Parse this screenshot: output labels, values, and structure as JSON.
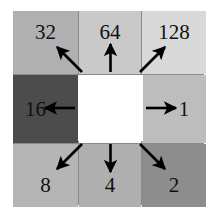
{
  "figure": {
    "name": "lbp-weight-grid",
    "center": {
      "fill": "#ffffff",
      "label": ""
    },
    "gridline_color": "#8a8a8a",
    "background": "#ffffff"
  },
  "cells": [
    {
      "id": "cell-32",
      "label": "32",
      "row": 0,
      "col": 0,
      "fill": "#b0b0b0",
      "arrow": "arrow-up-left"
    },
    {
      "id": "cell-64",
      "label": "64",
      "row": 0,
      "col": 1,
      "fill": "#c9c9c9",
      "arrow": "arrow-up"
    },
    {
      "id": "cell-128",
      "label": "128",
      "row": 0,
      "col": 2,
      "fill": "#d9d9d9",
      "arrow": "arrow-up-right"
    },
    {
      "id": "cell-16",
      "label": "16",
      "row": 1,
      "col": 0,
      "fill": "#4c4c4c",
      "arrow": "arrow-left"
    },
    {
      "id": "cell-center",
      "label": "",
      "row": 1,
      "col": 1,
      "fill": "#ffffff",
      "arrow": ""
    },
    {
      "id": "cell-1",
      "label": "1",
      "row": 1,
      "col": 2,
      "fill": "#bdbdbd",
      "arrow": "arrow-right"
    },
    {
      "id": "cell-8",
      "label": "8",
      "row": 2,
      "col": 0,
      "fill": "#b5b5b5",
      "arrow": "arrow-down-left"
    },
    {
      "id": "cell-4",
      "label": "4",
      "row": 2,
      "col": 1,
      "fill": "#afafaf",
      "arrow": "arrow-down"
    },
    {
      "id": "cell-2",
      "label": "2",
      "row": 2,
      "col": 2,
      "fill": "#8d8d8d",
      "arrow": "arrow-down-right"
    }
  ],
  "arrows": {
    "color": "#000000",
    "count": 8,
    "directions": [
      "up-left",
      "up",
      "up-right",
      "left",
      "right",
      "down-left",
      "down",
      "down-right"
    ]
  }
}
